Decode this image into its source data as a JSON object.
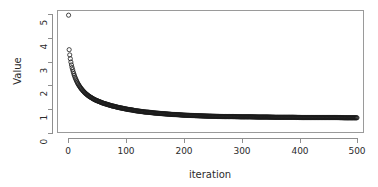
{
  "chart_data": {
    "type": "scatter",
    "title": "",
    "xlabel": "iteration",
    "ylabel": "Value",
    "xlim": [
      0,
      500
    ],
    "ylim": [
      0,
      5.2
    ],
    "xticks": [
      0,
      100,
      200,
      300,
      400,
      500
    ],
    "yticks": [
      0,
      1,
      2,
      3,
      4,
      5
    ],
    "xticklabels": [
      "0",
      "100",
      "200",
      "300",
      "400",
      "500"
    ],
    "yticklabels": [
      "0",
      "1",
      "2",
      "3",
      "4",
      "5"
    ],
    "grid": false,
    "legend": null,
    "marker": "open-circle",
    "marker_size": 2.1,
    "marker_color": "#1a1a1a",
    "frame_color": "#9a9a9a",
    "background": "#ffffff",
    "series": [
      {
        "name": "Value",
        "x": [
          1,
          2,
          3,
          4,
          5,
          6,
          7,
          8,
          9,
          10,
          11,
          12,
          13,
          14,
          15,
          16,
          17,
          18,
          19,
          20,
          22,
          24,
          26,
          28,
          30,
          32,
          34,
          36,
          38,
          40,
          44,
          48,
          52,
          56,
          60,
          64,
          68,
          72,
          76,
          80,
          86,
          92,
          98,
          104,
          110,
          116,
          122,
          128,
          134,
          140,
          150,
          160,
          170,
          180,
          190,
          200,
          210,
          220,
          230,
          240,
          255,
          270,
          285,
          300,
          315,
          330,
          345,
          360,
          375,
          390,
          405,
          420,
          435,
          450,
          465,
          480,
          495,
          500
        ],
        "y": [
          4.95,
          3.5,
          3.28,
          3.12,
          2.98,
          2.86,
          2.75,
          2.66,
          2.57,
          2.49,
          2.42,
          2.35,
          2.29,
          2.23,
          2.18,
          2.13,
          2.08,
          2.04,
          2.0,
          1.96,
          1.89,
          1.83,
          1.77,
          1.72,
          1.67,
          1.63,
          1.59,
          1.55,
          1.52,
          1.49,
          1.43,
          1.38,
          1.34,
          1.3,
          1.26,
          1.23,
          1.2,
          1.17,
          1.14,
          1.12,
          1.08,
          1.05,
          1.02,
          0.99,
          0.97,
          0.94,
          0.92,
          0.9,
          0.88,
          0.87,
          0.84,
          0.82,
          0.8,
          0.78,
          0.77,
          0.75,
          0.74,
          0.73,
          0.72,
          0.71,
          0.7,
          0.69,
          0.69,
          0.68,
          0.68,
          0.67,
          0.67,
          0.66,
          0.66,
          0.66,
          0.65,
          0.65,
          0.65,
          0.65,
          0.65,
          0.64,
          0.64,
          0.64
        ]
      }
    ],
    "annotations": [
      {
        "text": "initial value near 5 at iteration 1"
      },
      {
        "text": "curve converges to asymptote near 0.64"
      }
    ]
  },
  "axes": {
    "x_title": "iteration",
    "y_title": "Value"
  }
}
